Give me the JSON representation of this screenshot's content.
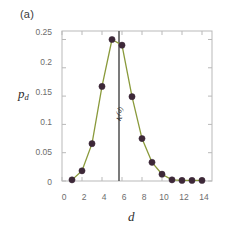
{
  "panel": {
    "label": "(a)"
  },
  "axes": {
    "xlabel": "d",
    "ylabel_main": "p",
    "ylabel_sub": "d",
    "xticks": [
      "0",
      "2",
      "4",
      "6",
      "8",
      "10",
      "12",
      "14"
    ],
    "yticks": [
      "0",
      "0.05",
      "0.1",
      "0.15",
      "0.2",
      "0.25"
    ]
  },
  "annotation": {
    "symbol": "κ",
    "superscript": "(d)",
    "line_value": 5.7,
    "color": "#5a5a5a"
  },
  "style": {
    "line_color": "#8a9a3b",
    "marker_color": "#3d2838",
    "axis_color": "#b9b9b9",
    "tick_text_color": "#6d6d6d",
    "background": "#ffffff"
  },
  "chart_data": {
    "type": "line",
    "title": "",
    "xlabel": "d",
    "ylabel": "p_d",
    "xlim": [
      0,
      15
    ],
    "ylim": [
      0,
      0.265
    ],
    "grid": false,
    "legend": null,
    "xticks": [
      0,
      2,
      4,
      6,
      8,
      10,
      12,
      14
    ],
    "yticks": [
      0,
      0.05,
      0.1,
      0.15,
      0.2,
      0.25
    ],
    "markers": true,
    "annotations": [
      {
        "type": "vline",
        "x": 5.7,
        "label": "κ^(d)",
        "color": "#5a5a5a"
      }
    ],
    "series": [
      {
        "name": "p_d",
        "x": [
          1,
          2,
          3,
          4,
          5,
          6,
          7,
          8,
          9,
          10,
          11,
          12,
          13,
          14
        ],
        "values": [
          0.002,
          0.018,
          0.066,
          0.167,
          0.25,
          0.24,
          0.149,
          0.075,
          0.033,
          0.012,
          0.002,
          0.001,
          0.001,
          0.001
        ]
      }
    ]
  }
}
